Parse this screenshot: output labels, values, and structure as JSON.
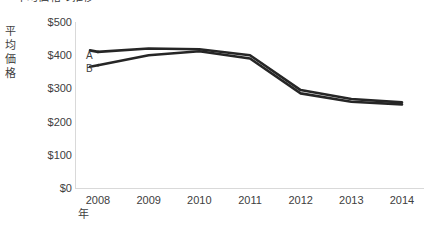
{
  "chart_data": {
    "type": "line",
    "title": "平均価格の推移",
    "xlabel": "年",
    "ylabel": "平均価格",
    "categories": [
      "2008",
      "2009",
      "2010",
      "2011",
      "2012",
      "2013",
      "2014"
    ],
    "x": [
      2008,
      2009,
      2010,
      2011,
      2012,
      2013,
      2014
    ],
    "series": [
      {
        "name": "A",
        "values": [
          410,
          420,
          418,
          400,
          295,
          268,
          258
        ]
      },
      {
        "name": "B",
        "values": [
          370,
          400,
          412,
          390,
          285,
          260,
          252
        ]
      }
    ],
    "ylim": [
      0,
      500
    ],
    "yticks": [
      500,
      400,
      300,
      200,
      100,
      0
    ],
    "ytick_labels": [
      "$500",
      "$400",
      "$300",
      "$200",
      "$100",
      "$0"
    ],
    "grid": false,
    "legend_position": "inline-left",
    "line_color": "#262626",
    "axis_color": "#d9d9d9",
    "text_color": "#404040",
    "background": "#ffffff"
  }
}
